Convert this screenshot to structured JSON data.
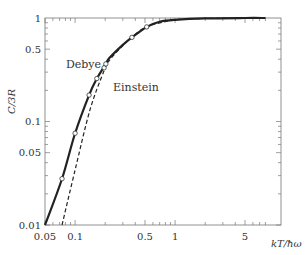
{
  "chart_data": {
    "type": "line",
    "title": "",
    "xlabel": "kT/ħω",
    "ylabel": "C/3R",
    "xscale": "log",
    "yscale": "log",
    "xlim": [
      0.05,
      8
    ],
    "ylim": [
      0.01,
      1
    ],
    "grid": false,
    "legend": "none (inline annotations)",
    "x_ticks": [
      {
        "value": 0.05,
        "label": "0.05"
      },
      {
        "value": 0.1,
        "label": "0.1"
      },
      {
        "value": 0.5,
        "label": "0.5"
      },
      {
        "value": 1,
        "label": "1"
      },
      {
        "value": 5,
        "label": "5"
      }
    ],
    "y_ticks": [
      {
        "value": 0.01,
        "label": "0.01"
      },
      {
        "value": 0.05,
        "label": "0.05"
      },
      {
        "value": 0.1,
        "label": "0.1"
      },
      {
        "value": 0.5,
        "label": "0.5"
      },
      {
        "value": 1,
        "label": "1"
      }
    ],
    "series": [
      {
        "name": "Debye",
        "style": "solid",
        "x": [
          0.05,
          0.074,
          0.1,
          0.138,
          0.165,
          0.203,
          0.22,
          0.3,
          0.37,
          0.52,
          0.7,
          1.0,
          2.0,
          5.0,
          8.0
        ],
        "y": [
          0.01,
          0.028,
          0.077,
          0.18,
          0.26,
          0.36,
          0.41,
          0.55,
          0.65,
          0.82,
          0.92,
          0.96,
          0.99,
          1.0,
          1.0
        ]
      },
      {
        "name": "Einstein",
        "style": "dashed",
        "x": [
          0.074,
          0.1,
          0.141,
          0.195,
          0.22,
          0.3,
          0.37,
          0.52,
          1.0,
          2.0,
          5.0,
          8.0
        ],
        "y": [
          0.01,
          0.034,
          0.13,
          0.31,
          0.39,
          0.54,
          0.65,
          0.82,
          0.96,
          0.99,
          1.0,
          1.0
        ]
      },
      {
        "name": "Experimental points",
        "style": "markers-open-circle",
        "x": [
          0.074,
          0.1,
          0.138,
          0.165,
          0.195,
          0.203,
          0.37,
          0.52
        ],
        "y": [
          0.028,
          0.077,
          0.18,
          0.26,
          0.33,
          0.36,
          0.65,
          0.82
        ]
      }
    ],
    "annotations": [
      {
        "text": "Debye",
        "x": 0.1,
        "y": 0.38
      },
      {
        "text": "Einstein",
        "x": 0.2,
        "y": 0.2
      }
    ]
  },
  "labels": {
    "xlabel": "kT/ħω",
    "ylabel": "C/3R",
    "debye": "Debye",
    "einstein": "Einstein"
  }
}
